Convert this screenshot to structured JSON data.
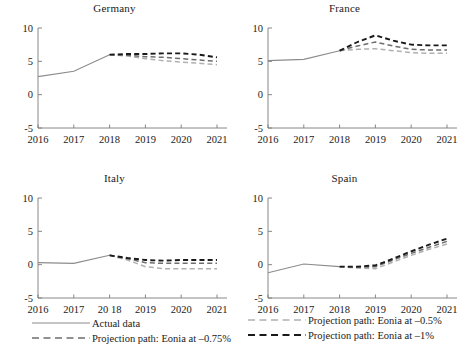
{
  "chart_data": {
    "type": "line",
    "title": "",
    "xlabel": "",
    "ylabel": "",
    "grid": false,
    "xlim": [
      2016,
      2021
    ],
    "ylim": [
      -5,
      10
    ],
    "yticks": [
      -5,
      0,
      5,
      10
    ],
    "ytick_labels": [
      "-5",
      "0",
      "5",
      "10"
    ],
    "legend_position": "bottom",
    "panels": [
      {
        "title": "Germany",
        "xtick_labels": [
          "2016",
          "2017",
          "2018",
          "2019",
          "2020",
          "2021"
        ],
        "x": [
          2016,
          2017,
          2018,
          2019,
          2020,
          2021
        ],
        "series": [
          {
            "name": "Actual data",
            "style": "solid",
            "color": "#8c8c8c",
            "x": [
              2016,
              2017,
              2018
            ],
            "values": [
              2.7,
              3.5,
              6.0
            ]
          },
          {
            "name": "Projection path: Eonia at -0.5%",
            "style": "dashed",
            "color": "#b0b0b0",
            "x": [
              2018,
              2018.5,
              2019,
              2019.5,
              2020,
              2020.5,
              2021
            ],
            "values": [
              6.0,
              5.8,
              5.4,
              5.1,
              4.9,
              4.7,
              4.5
            ]
          },
          {
            "name": "Projection path: Eonia at -0.75%",
            "style": "dashed",
            "color": "#6e6e6e",
            "x": [
              2018,
              2018.5,
              2019,
              2019.5,
              2020,
              2020.5,
              2021
            ],
            "values": [
              6.0,
              5.9,
              5.7,
              5.6,
              5.4,
              5.2,
              5.0
            ]
          },
          {
            "name": "Projection path: Eonia at -1%",
            "style": "dashed",
            "color": "#1a1a1a",
            "x": [
              2018,
              2018.5,
              2019,
              2019.5,
              2020,
              2020.5,
              2021
            ],
            "values": [
              6.0,
              6.1,
              6.1,
              6.2,
              6.2,
              6.0,
              5.6
            ]
          }
        ]
      },
      {
        "title": "France",
        "xtick_labels": [
          "2016",
          "2017",
          "2018",
          "2019",
          "2020",
          "2021"
        ],
        "x": [
          2016,
          2017,
          2018,
          2019,
          2020,
          2021
        ],
        "series": [
          {
            "name": "Actual data",
            "style": "solid",
            "color": "#8c8c8c",
            "x": [
              2016,
              2017,
              2018
            ],
            "values": [
              5.1,
              5.3,
              6.6
            ]
          },
          {
            "name": "Projection path: Eonia at -0.5%",
            "style": "dashed",
            "color": "#b0b0b0",
            "x": [
              2018,
              2018.5,
              2019,
              2019.5,
              2020,
              2020.5,
              2021
            ],
            "values": [
              6.6,
              6.8,
              6.9,
              6.6,
              6.3,
              6.2,
              6.2
            ]
          },
          {
            "name": "Projection path: Eonia at -0.75%",
            "style": "dashed",
            "color": "#6e6e6e",
            "x": [
              2018,
              2018.5,
              2019,
              2019.5,
              2020,
              2020.5,
              2021
            ],
            "values": [
              6.6,
              7.3,
              7.9,
              7.3,
              6.8,
              6.7,
              6.7
            ]
          },
          {
            "name": "Projection path: Eonia at -1%",
            "style": "dashed",
            "color": "#1a1a1a",
            "x": [
              2018,
              2018.5,
              2019,
              2019.5,
              2020,
              2020.5,
              2021
            ],
            "values": [
              6.6,
              7.9,
              8.9,
              8.1,
              7.5,
              7.4,
              7.4
            ]
          }
        ]
      },
      {
        "title": "Italy",
        "xtick_labels": [
          "2016",
          "2017",
          "20 18",
          "2019",
          "2020",
          "2021"
        ],
        "x": [
          2016,
          2017,
          2018,
          2019,
          2020,
          2021
        ],
        "series": [
          {
            "name": "Actual data",
            "style": "solid",
            "color": "#8c8c8c",
            "x": [
              2016,
              2017,
              2018
            ],
            "values": [
              0.3,
              0.2,
              1.4
            ]
          },
          {
            "name": "Projection path: Eonia at -0.5%",
            "style": "dashed",
            "color": "#b0b0b0",
            "x": [
              2018,
              2018.5,
              2019,
              2019.5,
              2020,
              2020.5,
              2021
            ],
            "values": [
              1.4,
              0.7,
              -0.3,
              -0.6,
              -0.6,
              -0.6,
              -0.6
            ]
          },
          {
            "name": "Projection path: Eonia at -0.75%",
            "style": "dashed",
            "color": "#6e6e6e",
            "x": [
              2018,
              2018.5,
              2019,
              2019.5,
              2020,
              2020.5,
              2021
            ],
            "values": [
              1.4,
              0.9,
              0.3,
              0.2,
              0.2,
              0.2,
              0.2
            ]
          },
          {
            "name": "Projection path: Eonia at -1%",
            "style": "dashed",
            "color": "#1a1a1a",
            "x": [
              2018,
              2018.5,
              2019,
              2019.5,
              2020,
              2020.5,
              2021
            ],
            "values": [
              1.4,
              1.0,
              0.7,
              0.6,
              0.7,
              0.7,
              0.7
            ]
          }
        ]
      },
      {
        "title": "Spain",
        "xtick_labels": [
          "2016",
          "2017",
          "2018",
          "2019",
          "2020",
          "2021"
        ],
        "x": [
          2016,
          2017,
          2018,
          2019,
          2020,
          2021
        ],
        "series": [
          {
            "name": "Actual data",
            "style": "solid",
            "color": "#8c8c8c",
            "x": [
              2016,
              2017,
              2018
            ],
            "values": [
              -1.2,
              0.1,
              -0.3
            ]
          },
          {
            "name": "Projection path: Eonia at -0.5%",
            "style": "dashed",
            "color": "#b0b0b0",
            "x": [
              2018,
              2018.5,
              2019,
              2019.5,
              2020,
              2020.5,
              2021
            ],
            "values": [
              -0.3,
              -0.5,
              -0.6,
              0.4,
              1.4,
              2.3,
              3.1
            ]
          },
          {
            "name": "Projection path: Eonia at -0.75%",
            "style": "dashed",
            "color": "#6e6e6e",
            "x": [
              2018,
              2018.5,
              2019,
              2019.5,
              2020,
              2020.5,
              2021
            ],
            "values": [
              -0.3,
              -0.4,
              -0.3,
              0.7,
              1.7,
              2.6,
              3.5
            ]
          },
          {
            "name": "Projection path: Eonia at -1%",
            "style": "dashed",
            "color": "#1a1a1a",
            "x": [
              2018,
              2018.5,
              2019,
              2019.5,
              2020,
              2020.5,
              2021
            ],
            "values": [
              -0.3,
              -0.3,
              -0.1,
              0.9,
              2.0,
              3.0,
              3.9
            ]
          }
        ]
      }
    ],
    "legend": {
      "left": [
        {
          "label": "Actual data",
          "style": "solid",
          "color": "#8c8c8c"
        },
        {
          "label": "Projection path: Eonia at –0.75%",
          "style": "dashed",
          "color": "#6e6e6e"
        }
      ],
      "right": [
        {
          "label": "Projection path: Eonia at –0.5%",
          "style": "dashed",
          "color": "#b0b0b0"
        },
        {
          "label": "Projection path: Eonia at –1%",
          "style": "dashed",
          "color": "#1a1a1a"
        }
      ]
    }
  }
}
